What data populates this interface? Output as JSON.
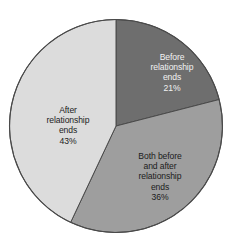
{
  "chart_data": {
    "type": "pie",
    "title": "",
    "subtitle": "",
    "xlabel": "",
    "ylabel": "",
    "legend_position": "none",
    "grid": false,
    "start_angle_deg": 0,
    "direction": "clockwise",
    "categories": [
      "Before relationship ends",
      "Both before and after relationship ends",
      "After relationship ends"
    ],
    "values": [
      21,
      36,
      43
    ],
    "value_labels": [
      "21%",
      "36%",
      "43%"
    ],
    "units": "percent",
    "total": 100,
    "colors": [
      "#6e6e6e",
      "#9e9e9e",
      "#dcdcdc"
    ],
    "slices": [
      {
        "name": "Before relationship ends",
        "label_lines": "Before\nrelationship\nends",
        "value": 21,
        "value_label": "21%",
        "color": "#6e6e6e",
        "text_color": "#f2f2f2",
        "start_deg": 0,
        "end_deg": 75.6
      },
      {
        "name": "Both before and after relationship ends",
        "label_lines": "Both before\nand after\nrelationship\nends",
        "value": 36,
        "value_label": "36%",
        "color": "#9e9e9e",
        "text_color": "#1c1c1c",
        "start_deg": 75.6,
        "end_deg": 205.2
      },
      {
        "name": "After relationship ends",
        "label_lines": "After\nrelationship\nends",
        "value": 43,
        "value_label": "43%",
        "color": "#dcdcdc",
        "text_color": "#1c1c1c",
        "start_deg": 205.2,
        "end_deg": 360
      }
    ],
    "outline_color": "#4a4a4a",
    "background_color": "#ffffff"
  }
}
